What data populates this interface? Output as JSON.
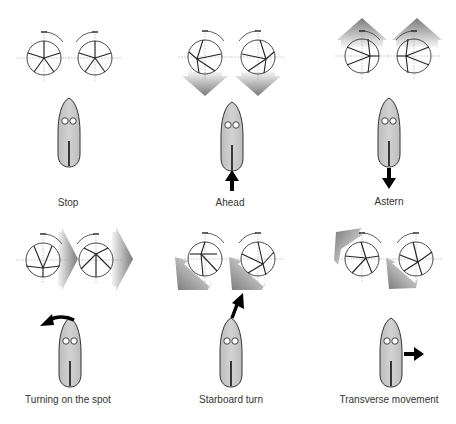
{
  "colors": {
    "hull_fill": "#c4c4c4",
    "hull_stroke": "#333333",
    "line": "#222222",
    "guide": "#9a9a9a",
    "thrust_dark": "#8a8a8a",
    "thrust_light": "#f2f2f2",
    "motion_arrow": "#000000"
  },
  "panels": [
    {
      "id": "stop",
      "label": "Stop",
      "thrust": "none",
      "motion": "none",
      "label_x": 68,
      "label_y": 197
    },
    {
      "id": "ahead",
      "label": "Ahead",
      "thrust": "down",
      "motion": "forward",
      "label_x": 230,
      "label_y": 197
    },
    {
      "id": "astern",
      "label": "Astern",
      "thrust": "up",
      "motion": "backward",
      "label_x": 389,
      "label_y": 196
    },
    {
      "id": "turning",
      "label": "Turning on the spot",
      "thrust": "right-both",
      "motion": "rotate-left",
      "label_x": 68,
      "label_y": 394
    },
    {
      "id": "starboard",
      "label": "Starboard turn",
      "thrust": "down-left",
      "motion": "forward-right",
      "label_x": 231,
      "label_y": 394
    },
    {
      "id": "transverse",
      "label": "Transverse movement",
      "thrust": "split-up-left-down-left",
      "motion": "right",
      "label_x": 389,
      "label_y": 394
    }
  ]
}
